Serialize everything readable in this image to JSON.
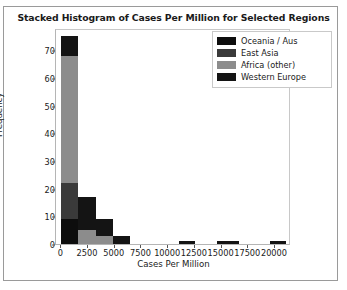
{
  "chart_data": {
    "type": "bar",
    "stacked": true,
    "title": "Stacked Histogram of Cases Per Million for Selected Regions",
    "xlabel": "Cases Per Million",
    "ylabel": "Frequency",
    "xlim": [
      -500,
      21500
    ],
    "ylim": [
      0,
      78
    ],
    "xticks": [
      0,
      2500,
      5000,
      7500,
      10000,
      12500,
      15000,
      17500,
      20000
    ],
    "xticklabels": [
      "0",
      "2500",
      "5000",
      "7500",
      "10000",
      "12500",
      "15000",
      "17500",
      "20000"
    ],
    "yticks": [
      0,
      10,
      20,
      30,
      40,
      50,
      60,
      70
    ],
    "yticklabels": [
      "0",
      "10",
      "20",
      "30",
      "40",
      "50",
      "60",
      "70"
    ],
    "grid": false,
    "legend_position": "upper right",
    "bin_edges": [
      0,
      1600,
      3200,
      4800,
      6400,
      8000,
      11000,
      12500,
      14600,
      16600,
      19500,
      21000
    ],
    "bins": [
      {
        "x0": 0,
        "x1": 1600,
        "total": 75,
        "values": {
          "Oceania / Aus": 9,
          "East Asia": 13,
          "Africa (other)": 46,
          "Western Europe": 7
        }
      },
      {
        "x0": 1600,
        "x1": 3200,
        "total": 17,
        "values": {
          "Oceania / Aus": 0,
          "East Asia": 0,
          "Africa (other)": 5,
          "Western Europe": 12
        }
      },
      {
        "x0": 3200,
        "x1": 4800,
        "total": 9,
        "values": {
          "Oceania / Aus": 0,
          "East Asia": 0,
          "Africa (other)": 3,
          "Western Europe": 6
        }
      },
      {
        "x0": 4800,
        "x1": 6400,
        "total": 3,
        "values": {
          "Oceania / Aus": 0,
          "East Asia": 0,
          "Africa (other)": 0,
          "Western Europe": 3
        }
      },
      {
        "x0": 11000,
        "x1": 12500,
        "total": 1,
        "values": {
          "Oceania / Aus": 0,
          "East Asia": 0,
          "Africa (other)": 0,
          "Western Europe": 1
        }
      },
      {
        "x0": 14600,
        "x1": 16600,
        "total": 1,
        "values": {
          "Oceania / Aus": 0,
          "East Asia": 0,
          "Africa (other)": 0,
          "Western Europe": 1
        }
      },
      {
        "x0": 19500,
        "x1": 21000,
        "total": 1,
        "values": {
          "Oceania / Aus": 0,
          "East Asia": 0,
          "Africa (other)": 0,
          "Western Europe": 1
        }
      }
    ],
    "series": [
      {
        "name": "Oceania / Aus",
        "color": "#0d0d0d",
        "values": [
          9,
          0,
          0,
          0,
          0,
          0,
          0
        ]
      },
      {
        "name": "East Asia",
        "color": "#3a3a3a",
        "values": [
          13,
          0,
          0,
          0,
          0,
          0,
          0
        ]
      },
      {
        "name": "Africa (other)",
        "color": "#8c8c8c",
        "values": [
          46,
          5,
          3,
          0,
          0,
          0,
          0
        ]
      },
      {
        "name": "Western Europe",
        "color": "#141414",
        "values": [
          7,
          12,
          6,
          3,
          1,
          1,
          1
        ]
      }
    ]
  },
  "legend": {
    "entries": [
      {
        "label": "Oceania / Aus",
        "color": "#0d0d0d"
      },
      {
        "label": "East Asia",
        "color": "#3a3a3a"
      },
      {
        "label": "Africa (other)",
        "color": "#8c8c8c"
      },
      {
        "label": "Western Europe",
        "color": "#141414"
      }
    ]
  }
}
